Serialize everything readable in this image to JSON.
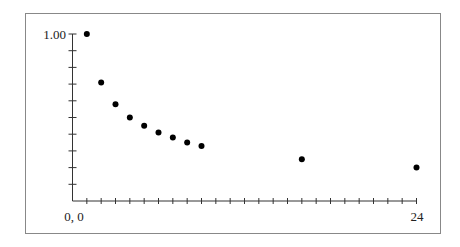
{
  "chart_data": {
    "type": "scatter",
    "title": "",
    "xlabel": "",
    "ylabel": "",
    "origin_label": "0, 0",
    "x_max_label": "24",
    "y_max_label": "1.00",
    "xlim": [
      0,
      24
    ],
    "ylim": [
      0,
      1.0
    ],
    "x_ticks": 24,
    "y_ticks": 10,
    "grid": false,
    "legend": null,
    "points": [
      {
        "x": 1,
        "y": 1.0
      },
      {
        "x": 2,
        "y": 0.71
      },
      {
        "x": 3,
        "y": 0.58
      },
      {
        "x": 4,
        "y": 0.5
      },
      {
        "x": 5,
        "y": 0.45
      },
      {
        "x": 6,
        "y": 0.41
      },
      {
        "x": 7,
        "y": 0.38
      },
      {
        "x": 8,
        "y": 0.35
      },
      {
        "x": 9,
        "y": 0.33
      },
      {
        "x": 16,
        "y": 0.25
      },
      {
        "x": 24,
        "y": 0.2
      }
    ]
  },
  "colors": {
    "frame": "#888888",
    "axis": "#333333",
    "point": "#000000"
  }
}
